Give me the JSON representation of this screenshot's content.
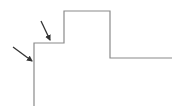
{
  "diagram": {
    "colors": {
      "line": "#8a8a8a",
      "arrow": "#333333",
      "background": "#ffffff"
    },
    "waveform_points": "34,106 34,43 64,43 64,11 110,11 110,58 172,58",
    "arrows": [
      {
        "name": "arrow-lower",
        "x1": 13,
        "y1": 47,
        "x2": 32,
        "y2": 61
      },
      {
        "name": "arrow-upper",
        "x1": 41,
        "y1": 21,
        "x2": 50,
        "y2": 40
      }
    ]
  }
}
